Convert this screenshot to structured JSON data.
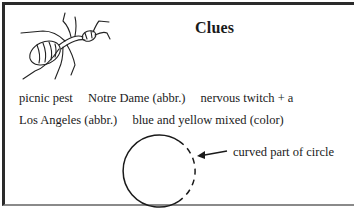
{
  "card": {
    "title": "Clues",
    "image": {
      "icon": "ant-icon",
      "description": "line drawing of an ant"
    },
    "clues_row1": [
      "picnic pest",
      "Notre Dame (abbr.)",
      "nervous twitch + a"
    ],
    "clues_row2": [
      "Los Angeles (abbr.)",
      "blue and yellow mixed (color)"
    ],
    "diagram": {
      "shape": "circle-with-dashed-arc",
      "annotation": "curved part of circle"
    }
  }
}
